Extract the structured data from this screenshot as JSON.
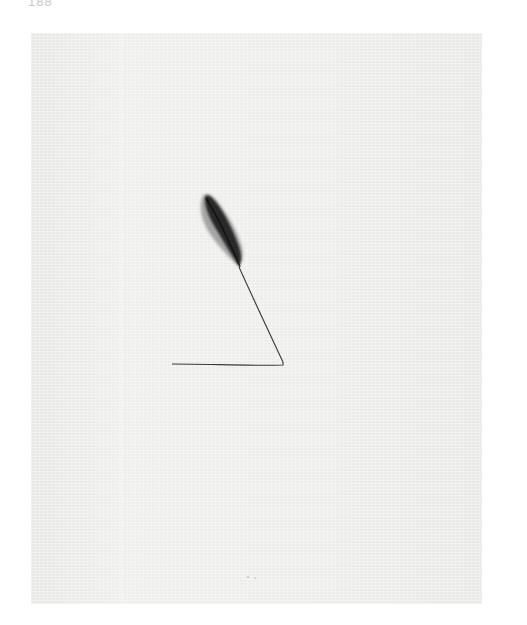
{
  "page": {
    "page_number": "188"
  },
  "artwork": {
    "description": "Minimal ink drawing of a dark feather attached to a thin line forming an open triangle",
    "colors": {
      "background": "#ffffff",
      "paper": "#ececea",
      "feather_dark": "#1e1e1e",
      "feather_light": "#7a7a7a",
      "line": "#3a3a3a"
    }
  }
}
